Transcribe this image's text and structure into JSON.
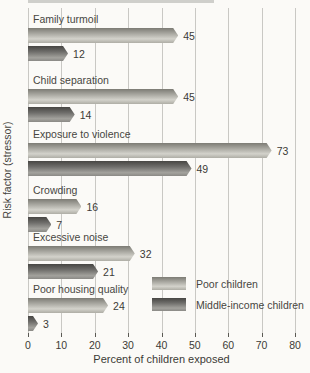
{
  "figure": {
    "background_color": "#fbfaf7",
    "gridline_color": "#c9c8c4",
    "top_strip_color": "#cfcfcb"
  },
  "chart_data": {
    "type": "bar",
    "orientation": "horizontal",
    "title": "",
    "categories": [
      "Family turmoil",
      "Child separation",
      "Exposure to violence",
      "Crowding",
      "Excessive noise",
      "Poor housing quality"
    ],
    "series": [
      {
        "name": "Poor children",
        "values": [
          45,
          45,
          73,
          16,
          32,
          24
        ],
        "color": "#b3b2ab"
      },
      {
        "name": "Middle-income children",
        "values": [
          12,
          14,
          49,
          7,
          21,
          3
        ],
        "color": "#6f6e6a"
      }
    ],
    "xlabel": "Percent of children exposed",
    "ylabel": "Risk factor (stressor)",
    "xlim": [
      0,
      80
    ],
    "xticks": [
      0,
      10,
      20,
      30,
      40,
      50,
      60,
      70,
      80
    ],
    "grid": true,
    "value_labels": true,
    "legend_position": "lower-right"
  }
}
